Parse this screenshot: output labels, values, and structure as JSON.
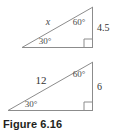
{
  "figure": {
    "caption": "Figure 6.16",
    "line_color": "#8c8c8c",
    "text_color": "#4a4a4a",
    "background": "#ffffff"
  },
  "triangles": [
    {
      "id": "upper-triangle",
      "hypotenuse_label": "x",
      "hypotenuse_label_style": "italic",
      "top_angle_label": "60°",
      "bottom_angle_label": "30°",
      "vertical_side_label": "4.5",
      "right_angle_marker": true
    },
    {
      "id": "lower-triangle",
      "hypotenuse_label": "12",
      "hypotenuse_label_style": "normal",
      "top_angle_label": "60°",
      "bottom_angle_label": "30°",
      "vertical_side_label": "6",
      "right_angle_marker": true
    }
  ]
}
